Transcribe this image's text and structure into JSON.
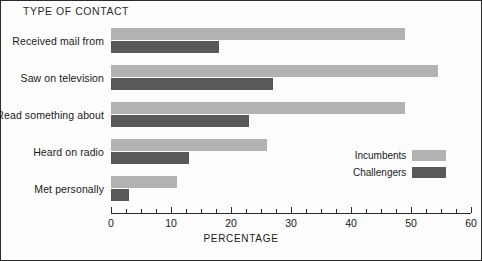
{
  "chart_data": {
    "type": "bar",
    "orientation": "horizontal",
    "title": "TYPE OF CONTACT",
    "xlabel": "PERCENTAGE",
    "ylabel": "",
    "xlim": [
      0,
      60
    ],
    "xticks": [
      0,
      10,
      20,
      30,
      40,
      50,
      60
    ],
    "xtick_labels": [
      "0",
      "10",
      "20",
      "30",
      "40",
      "50",
      "60"
    ],
    "minor_tick_interval": 2.5,
    "grid": false,
    "legend_position": "lower right inside",
    "categories": [
      "Received mail from",
      "Saw on television",
      "Read something about",
      "Heard on radio",
      "Met personally"
    ],
    "series": [
      {
        "name": "Incumbents",
        "color": "#b2b2b2",
        "values": [
          49,
          54.5,
          49,
          26,
          11
        ]
      },
      {
        "name": "Challengers",
        "color": "#595959",
        "values": [
          18,
          27,
          23,
          13,
          3
        ]
      }
    ]
  },
  "legend": {
    "entries": [
      {
        "label": "Incumbents",
        "swatch": "incumbent"
      },
      {
        "label": "Challengers",
        "swatch": "challenger"
      }
    ]
  }
}
